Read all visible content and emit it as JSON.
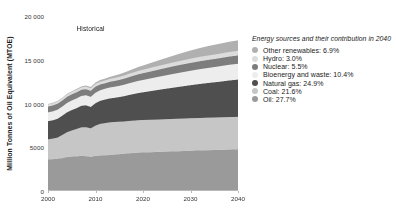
{
  "chart_data": {
    "type": "area",
    "stacked": true,
    "title": "",
    "xlabel": "",
    "ylabel": "Million Tonnes of Oil Equivalent (MTOE)",
    "xlim": [
      2000,
      2040
    ],
    "ylim": [
      0,
      20000
    ],
    "grid": false,
    "legend_position": "right",
    "x": [
      2000,
      2001,
      2002,
      2003,
      2004,
      2005,
      2006,
      2007,
      2008,
      2009,
      2010,
      2011,
      2012,
      2013,
      2014,
      2015,
      2016,
      2017,
      2018,
      2019,
      2020,
      2022,
      2024,
      2026,
      2028,
      2030,
      2032,
      2034,
      2036,
      2038,
      2040
    ],
    "x_ticks": [
      2000,
      2010,
      2020,
      2030,
      2040
    ],
    "x_tick_labels": [
      "2000",
      "2010",
      "2020",
      "2030",
      "2040"
    ],
    "y_ticks": [
      0,
      5000,
      10000,
      15000,
      20000
    ],
    "y_tick_labels": [
      "0",
      "5000",
      "10 000",
      "15 000",
      "20 000"
    ],
    "annotations": [
      {
        "text": "Historical",
        "x": 2006,
        "y": 19000
      }
    ],
    "series": [
      {
        "name": "Oil",
        "share_2040": "27.7%",
        "color": "#9a9a9a",
        "values": [
          3600,
          3640,
          3680,
          3760,
          3880,
          3930,
          3960,
          4010,
          3990,
          3900,
          4020,
          4050,
          4080,
          4120,
          4160,
          4210,
          4260,
          4310,
          4350,
          4380,
          4400,
          4440,
          4480,
          4520,
          4560,
          4600,
          4640,
          4670,
          4700,
          4730,
          4760
        ]
      },
      {
        "name": "Coal",
        "share_2040": "21.6%",
        "color": "#c6c6c6",
        "values": [
          2300,
          2340,
          2420,
          2640,
          2830,
          2990,
          3120,
          3260,
          3300,
          3260,
          3450,
          3620,
          3680,
          3730,
          3720,
          3700,
          3680,
          3690,
          3700,
          3710,
          3710,
          3710,
          3710,
          3710,
          3710,
          3710,
          3710,
          3710,
          3710,
          3710,
          3710
        ]
      },
      {
        "name": "Natural gas",
        "share_2040": "24.9%",
        "color": "#4f4f4f",
        "values": [
          2080,
          2110,
          2160,
          2210,
          2290,
          2340,
          2390,
          2470,
          2510,
          2450,
          2580,
          2640,
          2700,
          2740,
          2780,
          2830,
          2900,
          2970,
          3040,
          3110,
          3180,
          3310,
          3440,
          3560,
          3680,
          3790,
          3890,
          3990,
          4080,
          4190,
          4280
        ]
      },
      {
        "name": "Bioenergy and waste",
        "share_2040": "10.4%",
        "color": "#ededed",
        "values": [
          1000,
          1010,
          1020,
          1040,
          1060,
          1080,
          1100,
          1120,
          1140,
          1150,
          1180,
          1200,
          1220,
          1240,
          1260,
          1280,
          1300,
          1330,
          1350,
          1380,
          1400,
          1450,
          1500,
          1550,
          1600,
          1650,
          1690,
          1720,
          1750,
          1780,
          1800
        ]
      },
      {
        "name": "Nuclear",
        "share_2040": "5.5%",
        "color": "#7d7d7d",
        "values": [
          675,
          690,
          700,
          700,
          715,
          720,
          720,
          710,
          710,
          700,
          715,
          680,
          640,
          650,
          665,
          680,
          700,
          720,
          740,
          760,
          780,
          810,
          840,
          870,
          890,
          900,
          915,
          925,
          935,
          945,
          950
        ]
      },
      {
        "name": "Hydro",
        "share_2040": "3.0%",
        "color": "#dcdcdc",
        "values": [
          225,
          230,
          232,
          235,
          245,
          250,
          260,
          265,
          275,
          280,
          295,
          300,
          310,
          320,
          330,
          340,
          350,
          360,
          370,
          380,
          390,
          405,
          420,
          435,
          450,
          465,
          480,
          490,
          500,
          510,
          520
        ]
      },
      {
        "name": "Other renewables",
        "share_2040": "6.9%",
        "color": "#b0b0b0",
        "values": [
          60,
          64,
          70,
          76,
          84,
          92,
          102,
          115,
          130,
          145,
          165,
          190,
          215,
          240,
          270,
          300,
          335,
          370,
          410,
          450,
          490,
          580,
          670,
          760,
          850,
          940,
          1020,
          1090,
          1140,
          1180,
          1190
        ]
      }
    ]
  },
  "legend": {
    "title": "Energy sources and their contribution in 2040",
    "items": [
      {
        "label": "Other renewables: 6.9%",
        "color": "#b0b0b0"
      },
      {
        "label": "Hydro: 3.0%",
        "color": "#dcdcdc"
      },
      {
        "label": "Nuclear: 5.5%",
        "color": "#7d7d7d"
      },
      {
        "label": "Bioenergy and waste: 10.4%",
        "color": "#ededed"
      },
      {
        "label": "Natural gas: 24.9%",
        "color": "#4f4f4f"
      },
      {
        "label": "Coal: 21.6%",
        "color": "#c6c6c6"
      },
      {
        "label": "Oil: 27.7%",
        "color": "#9a9a9a"
      }
    ]
  }
}
